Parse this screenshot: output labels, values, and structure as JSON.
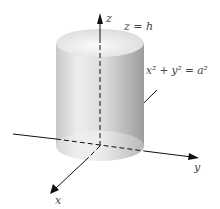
{
  "diagram": {
    "type": "3d-cylinder-coordinate-sketch",
    "axes": {
      "x_label": "x",
      "y_label": "y",
      "z_label": "z"
    },
    "annotations": {
      "top_plane": "z = h",
      "cylinder_surface": "x² + y² = a²"
    },
    "colors": {
      "cylinder_light": "#f2f2f2",
      "cylinder_dark": "#9a9a9a",
      "axis": "#111111",
      "label": "#444444"
    }
  }
}
